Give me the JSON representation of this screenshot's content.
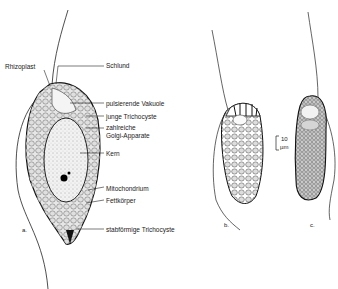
{
  "figure": {
    "panels": [
      {
        "id": "a",
        "label": "a."
      },
      {
        "id": "b",
        "label": "b."
      },
      {
        "id": "c",
        "label": "c."
      }
    ],
    "labels": {
      "rhizoplast": "Rhizoplast",
      "schlund": "Schlund",
      "pulsierende_vakuole": "pulsierende Vakuole",
      "junge_trichocyste": "junge Trichocyste",
      "golgi_line1": "zahlreiche",
      "golgi_line2": "Golgi-Apparate",
      "kern": "Kern",
      "mitochondrium": "Mitochondrium",
      "fettkoerper": "Fettkörper",
      "stabfoermige_trichocyste": "stabförmige Trichocyste"
    },
    "scale_bar": {
      "value": "10",
      "unit": "µm"
    }
  }
}
